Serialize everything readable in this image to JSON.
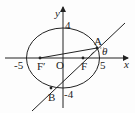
{
  "diagram": {
    "type": "ellipse-focal-chord",
    "axes": {
      "x_label": "x",
      "y_label": "y",
      "origin_label": "O"
    },
    "ellipse": {
      "a": 5,
      "b": 4,
      "ticks": {
        "x_neg": "-5",
        "x_pos": "5",
        "y_pos": "4",
        "y_neg": "-4"
      }
    },
    "points": {
      "A": "A",
      "B": "B",
      "F": "F",
      "F_prime": "F′"
    },
    "angle_label": "θ",
    "colors": {
      "stroke": "#222222",
      "background": "#fdfdfd"
    }
  }
}
